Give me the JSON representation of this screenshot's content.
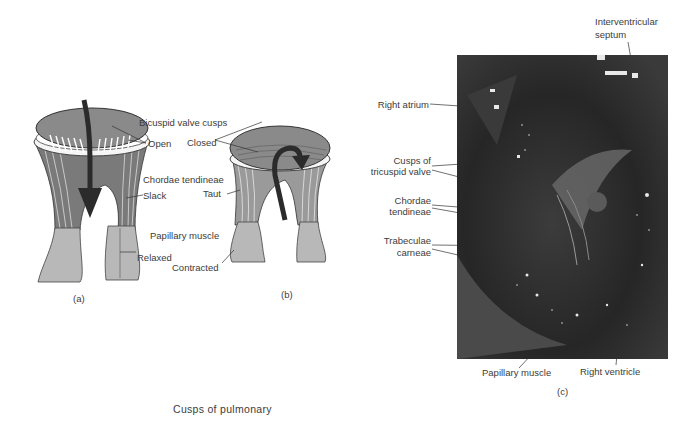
{
  "figure": {
    "panel_a": {
      "caption": "(a)",
      "state": "open",
      "labels": {
        "open": "Open",
        "slack": "Slack",
        "relaxed": "Relaxed"
      }
    },
    "shared_labels": {
      "bicuspid_valve_cusps": "Bicuspid valve cusps",
      "chordae_tendineae": "Chordae tendineae",
      "papillary_muscle": "Papillary muscle"
    },
    "panel_b": {
      "caption": "(b)",
      "state": "closed",
      "labels": {
        "closed": "Closed",
        "taut": "Taut",
        "contracted": "Contracted"
      }
    },
    "panel_c": {
      "caption": "(c)",
      "labels": {
        "interventricular_septum_1": "Interventricular",
        "interventricular_septum_2": "septum",
        "right_atrium": "Right atrium",
        "cusps_tricuspid_1": "Cusps of",
        "cusps_tricuspid_2": "tricuspid valve",
        "chordae_1": "Chordae",
        "chordae_2": "tendineae",
        "trabeculae_1": "Trabeculae",
        "trabeculae_2": "carneae",
        "papillary_muscle": "Papillary muscle",
        "right_ventricle": "Right ventricle"
      }
    },
    "bottom_caption": "Cusps of pulmonary"
  },
  "colors": {
    "valve_fill": "#8a8a8a",
    "muscle_fill": "#b8b8b8",
    "arrow": "#2b2b2b",
    "photo_bg": "#2a2a2a"
  }
}
